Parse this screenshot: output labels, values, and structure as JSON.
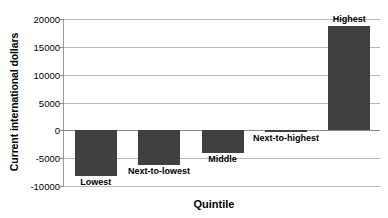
{
  "chart_data": {
    "type": "bar",
    "title": "",
    "xlabel": "Quintile",
    "ylabel": "Current international dollars",
    "categories": [
      "Lowest",
      "Next-to-lowest",
      "Middle",
      "Next-to-highest",
      "Highest"
    ],
    "values": [
      -8200,
      -6200,
      -4000,
      -300,
      18800
    ],
    "ylim": [
      -10000,
      20000
    ],
    "yticks": [
      20000,
      15000,
      10000,
      5000,
      0,
      -5000,
      -10000
    ],
    "ytick_labels": [
      "20000",
      "15000",
      "10000",
      "5000",
      "0",
      "-5000",
      "-10000"
    ],
    "grid": true,
    "legend": "none",
    "bar_color": "#404040",
    "series": [
      {
        "name": "Current international dollars",
        "values": [
          -8200,
          -6200,
          -4000,
          -300,
          18800
        ]
      }
    ],
    "point_labels": [
      "Lowest",
      "Next-to-lowest",
      "Middle",
      "Next-to-highest",
      "Highest"
    ]
  },
  "axes": {
    "y_title": "Current international dollars",
    "x_title": "Quintile"
  }
}
